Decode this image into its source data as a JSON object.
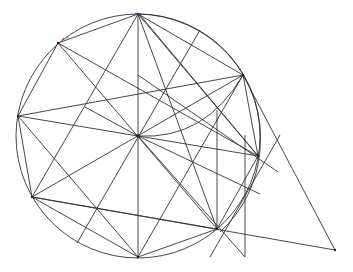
{
  "diagram": {
    "type": "geometric-construction",
    "colors": {
      "stroke": "#333333",
      "background": "#ffffff",
      "mark_blue": "#3b3bb0",
      "mark_red": "#d05070",
      "mark_green": "#50c0a0"
    },
    "circle": {
      "cx": 138,
      "cy": 136,
      "r": 122
    },
    "circle2": {
      "cx": 142,
      "cy": 138,
      "r": 120
    },
    "points": {
      "O": [
        138,
        136
      ],
      "T": [
        138,
        14
      ],
      "UL": [
        58,
        43
      ],
      "R1": [
        243,
        75
      ],
      "L": [
        18,
        116
      ],
      "R2": [
        258,
        156
      ],
      "LL": [
        32,
        197
      ],
      "LR": [
        217,
        229
      ],
      "B": [
        138,
        257
      ],
      "F": [
        335,
        250
      ]
    }
  }
}
